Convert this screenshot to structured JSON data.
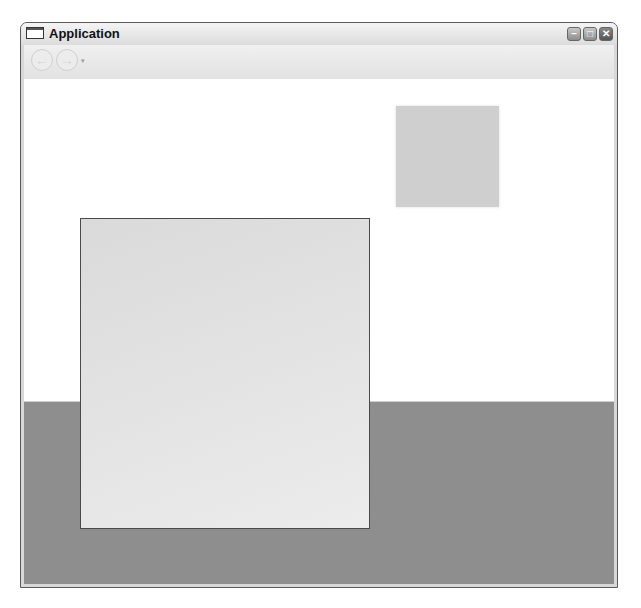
{
  "window": {
    "title": "Application",
    "controls": {
      "minimize": "–",
      "maximize": "□",
      "close": "✕"
    }
  },
  "navbar": {
    "back_icon": "←",
    "forward_icon": "→",
    "history_dropdown": "▾"
  },
  "colors": {
    "background_upper": "#ffffff",
    "background_lower": "#8e8e8e",
    "large_panel": "#e3e3e3",
    "small_panel": "#cfcfcf"
  }
}
